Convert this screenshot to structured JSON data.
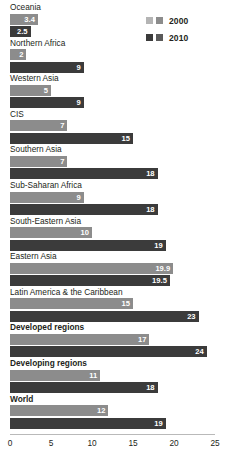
{
  "chart_data": {
    "type": "bar",
    "orientation": "horizontal",
    "title": "",
    "subtitle": "",
    "xlabel": "",
    "ylabel": "",
    "xlim": [
      0,
      25
    ],
    "xticks": [
      0,
      5,
      10,
      15,
      20,
      25
    ],
    "xtick_labels": [
      "0",
      "5",
      "10",
      "15",
      "20",
      "25"
    ],
    "grid": false,
    "legend_position": "top-right",
    "categories": [
      "Oceania",
      "Northern Africa",
      "Western Asia",
      "CIS",
      "Southern Asia",
      "Sub-Saharan Africa",
      "South-Eastern Asia",
      "Eastern Asia",
      "Latin America & the Caribbean",
      "Developed regions",
      "Developing regions",
      "World"
    ],
    "bold_categories": [
      "Developed regions",
      "Developing regions",
      "World"
    ],
    "series": [
      {
        "name": "2000",
        "color": "#8c8c8c",
        "values": [
          3.4,
          2,
          5,
          7,
          7,
          9,
          10,
          19.9,
          15,
          17,
          11,
          12
        ],
        "value_labels": [
          "3.4",
          "2",
          "5",
          "7",
          "7",
          "9",
          "10",
          "19.9",
          "15",
          "17",
          "11",
          "12"
        ]
      },
      {
        "name": "2010",
        "color": "#3b3b3b",
        "values": [
          2.5,
          9,
          9,
          15,
          18,
          18,
          19,
          19.5,
          23,
          24,
          18,
          19
        ],
        "value_labels": [
          "2.5",
          "9",
          "9",
          "15",
          "18",
          "18",
          "19",
          "19.5",
          "23",
          "24",
          "18",
          "19"
        ]
      }
    ]
  },
  "legend": {
    "entries": [
      {
        "label": "2000",
        "swatch_a": "#b4b4b4",
        "swatch_b": "#8c8c8c"
      },
      {
        "label": "2010",
        "swatch_a": "#3b3b3b",
        "swatch_b": "#5a5a5a"
      }
    ]
  },
  "colors": {
    "series_2000": "#8c8c8c",
    "series_2010": "#3b3b3b",
    "axis": "#b9b9b9",
    "text": "#231f20",
    "value_text": "#ffffff",
    "background": "#ffffff"
  }
}
